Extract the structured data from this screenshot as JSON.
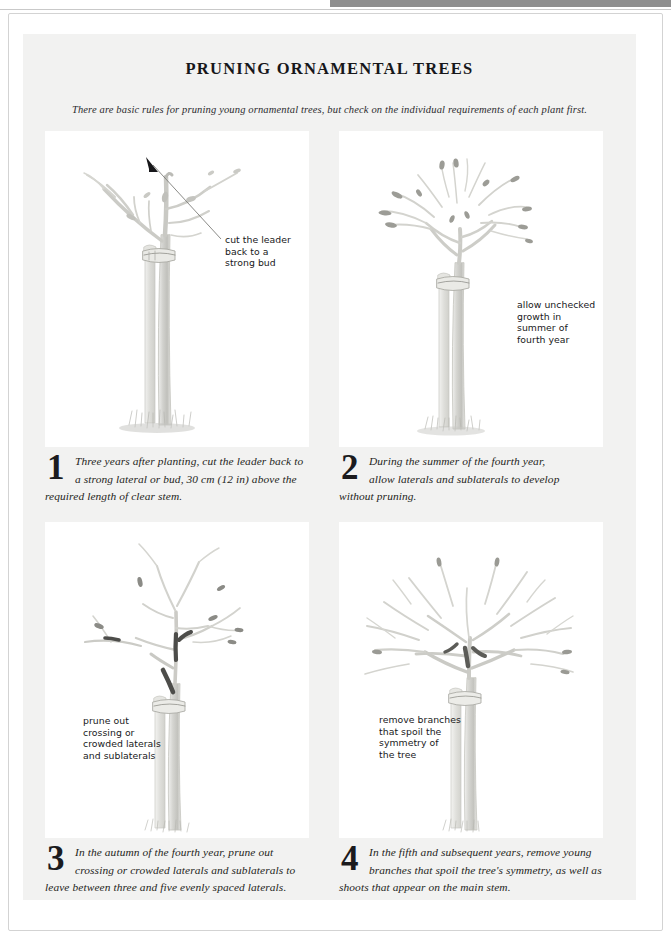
{
  "header": {
    "title": "PRUNING ORNAMENTAL TREES",
    "subtitle": "There are basic rules for pruning young ornamental trees, but check on the individual requirements of each plant first."
  },
  "panels": [
    {
      "number": "1",
      "callout": "cut the leader\nback to a\nstrong bud",
      "caption_line1": "Three years after planting, cut the leader back to",
      "caption_line2": "a strong lateral or bud, 30 cm (12 in) above the",
      "caption_line3": "required length of clear stem.",
      "illustration": "young-staked-tree-with-leader-cut"
    },
    {
      "number": "2",
      "callout": "allow unchecked\ngrowth in\nsummer of\nfourth year",
      "caption_line1": "During the summer of the fourth year,",
      "caption_line2": "allow laterals and sublaterals to develop",
      "caption_line3": "without pruning.",
      "illustration": "tree-with-unchecked-lateral-growth"
    },
    {
      "number": "3",
      "callout": "prune out\ncrossing or\ncrowded laterals\nand sublaterals",
      "caption_line1": "In the autumn of the fourth year, prune out",
      "caption_line2": "crossing or crowded laterals and sublaterals to",
      "caption_line3": "leave between three and five evenly spaced laterals.",
      "illustration": "tree-with-marked-crossing-laterals"
    },
    {
      "number": "4",
      "callout": "remove branches\nthat spoil the\nsymmetry of\nthe tree",
      "caption_line1": "In the fifth and subsequent years, remove young",
      "caption_line2": "branches that spoil the tree's symmetry, as well as",
      "caption_line3": "shoots that appear on the main stem.",
      "illustration": "mature-tree-with-symmetrical-crown"
    }
  ],
  "colors": {
    "page_background": "#ffffff",
    "content_block": "#f2f2f1",
    "illustration_background": "#ffffff",
    "text": "#1b1b1e",
    "branch_light": "#d7d7d4",
    "branch_mid": "#b9b9b5",
    "branch_dark": "#6a6a66",
    "cut_mark": "#3a3a38",
    "scan_bar": "#8e8e8e"
  }
}
